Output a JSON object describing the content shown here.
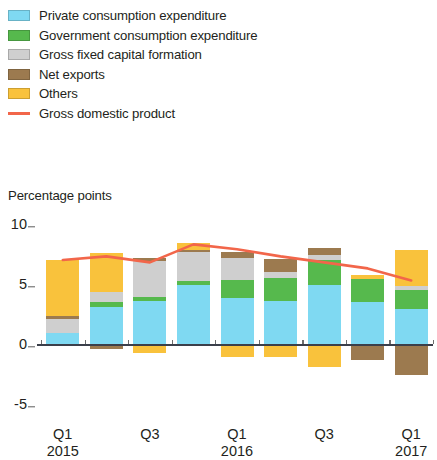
{
  "legend": {
    "items": [
      {
        "label": "Private consumption expenditure",
        "color": "#7fd9f2",
        "marker": "swatch",
        "key": "private"
      },
      {
        "label": "Government consumption expenditure",
        "color": "#56b94d",
        "marker": "swatch",
        "key": "government"
      },
      {
        "label": "Gross fixed capital formation",
        "color": "#cfcfcf",
        "marker": "swatch",
        "key": "gfcf"
      },
      {
        "label": "Net exports",
        "color": "#9c7a4f",
        "marker": "swatch",
        "key": "netexports"
      },
      {
        "label": "Others",
        "color": "#f9c23c",
        "marker": "swatch",
        "key": "others"
      },
      {
        "label": "Gross domestic product",
        "color": "#f2664a",
        "marker": "line",
        "key": "gdp"
      }
    ]
  },
  "axis": {
    "unit_caption": "Percentage points",
    "y_ticks": [
      "10",
      "5",
      "0",
      "-5"
    ],
    "y_tick_values": [
      10,
      5,
      0,
      -5
    ],
    "x_labels": [
      {
        "quarter": "Q1",
        "year": "2015",
        "bar_index": 0
      },
      {
        "quarter": "Q3",
        "year": "",
        "bar_index": 2
      },
      {
        "quarter": "Q1",
        "year": "2016",
        "bar_index": 4
      },
      {
        "quarter": "Q3",
        "year": "",
        "bar_index": 6
      },
      {
        "quarter": "Q1",
        "year": "2017",
        "bar_index": 8
      }
    ]
  },
  "chart_data": {
    "type": "bar",
    "title": "",
    "subtitle": "",
    "xlabel": "",
    "ylabel": "Percentage points",
    "ylim": [
      -5.8,
      10.8
    ],
    "grid": false,
    "stacked": true,
    "legend_position": "above-plot",
    "categories": [
      "Q1 2015",
      "Q2 2015",
      "Q3 2015",
      "Q4 2015",
      "Q1 2016",
      "Q2 2016",
      "Q3 2016",
      "Q4 2016",
      "Q1 2017"
    ],
    "series": [
      {
        "name": "Private consumption expenditure",
        "color": "#7fd9f2",
        "values": [
          0.9,
          3.1,
          3.6,
          4.9,
          3.8,
          3.6,
          4.9,
          3.5,
          2.9
        ]
      },
      {
        "name": "Government consumption expenditure",
        "color": "#56b94d",
        "values": [
          0.0,
          0.4,
          0.35,
          0.35,
          1.5,
          1.9,
          2.1,
          1.9,
          1.6
        ]
      },
      {
        "name": "Gross fixed capital formation",
        "color": "#cfcfcf",
        "values": [
          1.2,
          0.8,
          3.0,
          2.4,
          1.9,
          0.5,
          0.4,
          0.0,
          0.3
        ]
      },
      {
        "name": "Net exports",
        "color": "#9c7a4f",
        "values": [
          0.2,
          -0.45,
          0.25,
          0.2,
          0.5,
          1.1,
          0.6,
          -1.3,
          -2.6
        ]
      },
      {
        "name": "Others",
        "color": "#f9c23c",
        "values": [
          4.7,
          3.3,
          -0.75,
          0.6,
          -1.1,
          -1.1,
          -1.9,
          0.35,
          3.0
        ]
      }
    ],
    "line_series": {
      "name": "Gross domestic product",
      "color": "#f2664a",
      "values": [
        7.0,
        7.3,
        6.8,
        8.3,
        7.9,
        7.3,
        6.8,
        6.3,
        5.3
      ]
    }
  }
}
